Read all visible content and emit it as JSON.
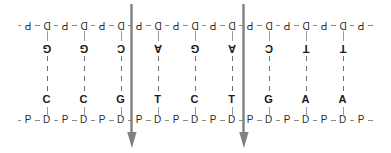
{
  "figure": {
    "type": "dna-backbone-diagram",
    "width": 391,
    "height": 153,
    "background_color": "#ffffff",
    "letter_color": "#2b2b2b",
    "base_color": "#1a1a1a",
    "line_color": "#8a8a8a",
    "bond_color": "#6e6e6e",
    "arrow_color": "#808080"
  },
  "legend": {
    "P": "phosphate",
    "D": "deoxyribose sugar",
    "A": "adenine",
    "T": "thymine",
    "G": "guanine",
    "C": "cytosine"
  },
  "top_strand": {
    "orientation": "inverted",
    "rotation_degrees": 180,
    "backbone": [
      "P",
      "D",
      "P",
      "D",
      "P",
      "D",
      "P",
      "D",
      "P",
      "D",
      "P",
      "D",
      "P",
      "D",
      "P",
      "D",
      "P",
      "D",
      "P"
    ],
    "backbone_x": [
      28,
      46.5,
      65,
      83.5,
      102,
      120.5,
      139,
      157.5,
      176,
      194.5,
      213,
      231.5,
      250,
      268.5,
      287,
      305.5,
      324,
      342.5,
      361
    ],
    "bases": [
      "G",
      "G",
      "C",
      "A",
      "G",
      "A",
      "C",
      "T",
      "T"
    ],
    "base_x": [
      46.5,
      83.5,
      120.5,
      157.5,
      194.5,
      231.5,
      268.5,
      305.5,
      342.5
    ]
  },
  "bottom_strand": {
    "orientation": "upright",
    "rotation_degrees": 0,
    "backbone": [
      "P",
      "D",
      "P",
      "D",
      "P",
      "D",
      "P",
      "D",
      "P",
      "D",
      "P",
      "D",
      "P",
      "D",
      "P",
      "D",
      "P",
      "D",
      "P"
    ],
    "backbone_x": [
      28,
      46.5,
      65,
      83.5,
      102,
      120.5,
      139,
      157.5,
      176,
      194.5,
      213,
      231.5,
      250,
      268.5,
      287,
      305.5,
      324,
      342.5,
      361
    ],
    "bases": [
      "C",
      "C",
      "G",
      "T",
      "C",
      "T",
      "G",
      "A",
      "A"
    ],
    "base_x": [
      46.5,
      83.5,
      120.5,
      157.5,
      194.5,
      231.5,
      268.5,
      305.5,
      342.5
    ]
  },
  "base_pairs": [
    {
      "top": "G",
      "bottom": "C"
    },
    {
      "top": "G",
      "bottom": "C"
    },
    {
      "top": "C",
      "bottom": "G"
    },
    {
      "top": "A",
      "bottom": "T"
    },
    {
      "top": "G",
      "bottom": "C"
    },
    {
      "top": "A",
      "bottom": "T"
    },
    {
      "top": "C",
      "bottom": "G"
    },
    {
      "top": "T",
      "bottom": "A"
    },
    {
      "top": "T",
      "bottom": "A"
    }
  ],
  "arrows": [
    {
      "x": 132,
      "direction": "down",
      "color": "#808080"
    },
    {
      "x": 244,
      "direction": "down",
      "color": "#808080"
    }
  ]
}
